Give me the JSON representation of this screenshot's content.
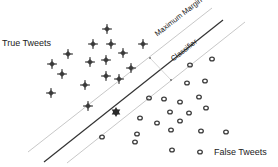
{
  "labels": {
    "true_class": "True Tweets",
    "false_class": "False Tweets",
    "margin": "Maximum Margin",
    "classifier": "Classifier"
  },
  "colors": {
    "classifier_line": "#333333",
    "margin_line": "#c8c8c8",
    "marker": "#3a3a3a"
  },
  "true_points": [
    [
      107,
      29
    ],
    [
      93,
      44
    ],
    [
      111,
      44
    ],
    [
      143,
      44
    ],
    [
      68,
      54
    ],
    [
      123,
      53
    ],
    [
      90,
      62
    ],
    [
      106,
      60
    ],
    [
      52,
      64
    ],
    [
      131,
      68
    ],
    [
      62,
      74
    ],
    [
      106,
      76
    ],
    [
      119,
      79
    ],
    [
      85,
      85
    ],
    [
      51,
      93
    ],
    [
      88,
      106
    ]
  ],
  "support_vector": [
    116,
    112
  ],
  "false_points": [
    [
      190,
      65
    ],
    [
      212,
      59
    ],
    [
      187,
      83
    ],
    [
      205,
      81
    ],
    [
      149,
      98
    ],
    [
      164,
      99
    ],
    [
      180,
      102
    ],
    [
      199,
      97
    ],
    [
      170,
      112
    ],
    [
      189,
      113
    ],
    [
      206,
      108
    ],
    [
      140,
      118
    ],
    [
      157,
      123
    ],
    [
      180,
      121
    ],
    [
      137,
      134
    ],
    [
      135,
      142
    ],
    [
      171,
      130
    ],
    [
      201,
      131
    ],
    [
      226,
      132
    ],
    [
      102,
      137
    ],
    [
      172,
      150
    ],
    [
      200,
      152
    ]
  ]
}
